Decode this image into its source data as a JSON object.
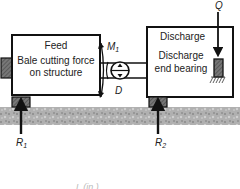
{
  "diagram": {
    "feed_box": {
      "title": "Feed",
      "line1": "Bale cutting force",
      "line2": "on structure"
    },
    "discharge_box": {
      "title": "Discharge",
      "line1": "Discharge",
      "line2": "end bearing"
    },
    "labels": {
      "moment": "M",
      "moment_sub": "1",
      "diameter": "D",
      "load": "Q",
      "reaction1": "R",
      "reaction1_sub": "1",
      "reaction2": "R",
      "reaction2_sub": "2",
      "axis_label": "L (in.)"
    },
    "colors": {
      "outline": "#111111",
      "ground": "#a8a8a8",
      "support": "#555555",
      "background": "#ffffff"
    }
  }
}
